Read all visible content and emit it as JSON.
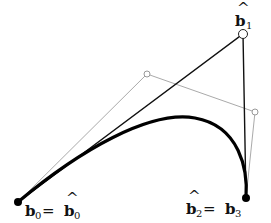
{
  "diagram": {
    "points": {
      "b0": {
        "x": 18,
        "y": 202
      },
      "b1_hat": {
        "x": 243,
        "y": 34
      },
      "gray1": {
        "x": 147,
        "y": 74
      },
      "gray2": {
        "x": 255,
        "y": 112
      },
      "b3": {
        "x": 246,
        "y": 198
      }
    },
    "labels": {
      "b0_eq": {
        "main": "b",
        "sub": "0",
        "eq": " = ",
        "main2": "b",
        "sub2": "0",
        "hat2": "^"
      },
      "b1_hat": {
        "main": "b",
        "sub": "1",
        "hat": "^"
      },
      "b2_eq": {
        "main": "b",
        "sub": "2",
        "hat": "^",
        "eq": " = ",
        "main2": "b",
        "sub2": "3"
      }
    },
    "colors": {
      "curve": "#000000",
      "control_polygon": "#111111",
      "gray_polygon": "#aaaaaa"
    }
  }
}
